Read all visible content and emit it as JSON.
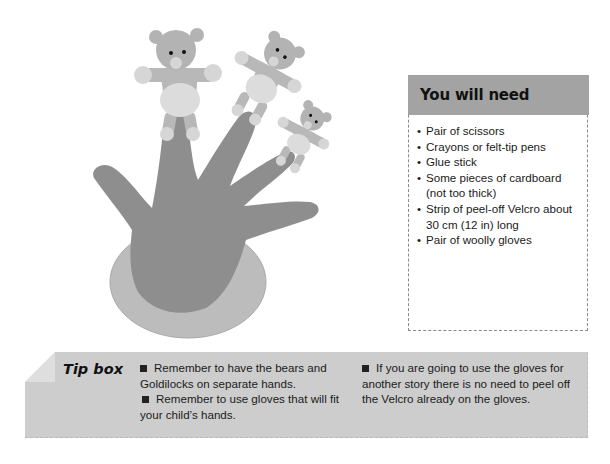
{
  "illustration": {
    "description": "Hand-shaped glove with three teddy bear finger puppets",
    "icon": "hand-with-bear-puppets-illustration"
  },
  "you_will_need": {
    "title": "You will need",
    "bullet": "•",
    "items": [
      "Pair of scissors",
      "Crayons or felt-tip pens",
      "Glue stick",
      "Some pieces of cardboard (not too thick)",
      "Strip of peel-off Velcro about 30 cm (12 in) long",
      "Pair of woolly gloves"
    ]
  },
  "tip_box": {
    "label": "Tip box",
    "column1": [
      "Remember to have the bears and Goldilocks on separate hands.",
      "Remember to use gloves that will fit your child’s hands."
    ],
    "column2": [
      "If you are going to use the gloves for another story there is no need to peel off the Velcro already on the gloves."
    ]
  },
  "colors": {
    "header_bg": "#a3a3a3",
    "tip_bg": "#cdcdcd",
    "hand": "#8c8c8c",
    "oval": "#b9b9b9",
    "bear": "#b3b3b3",
    "bear_light": "#d9d9d9"
  }
}
